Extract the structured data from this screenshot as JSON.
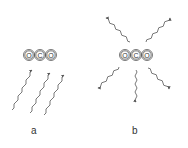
{
  "panels": [
    {
      "label": "a",
      "molecule": {
        "atoms": [
          "O",
          "C",
          "O"
        ],
        "center": [
          40,
          55
        ]
      },
      "radiation": "incoming photons from below (absorbed)"
    },
    {
      "label": "b",
      "molecule": {
        "atoms": [
          "O",
          "C",
          "O"
        ],
        "center": [
          136,
          55
        ]
      },
      "radiation": "photons emitted in all directions"
    }
  ],
  "colors": {
    "stroke": "#555555",
    "text": "#333333"
  }
}
